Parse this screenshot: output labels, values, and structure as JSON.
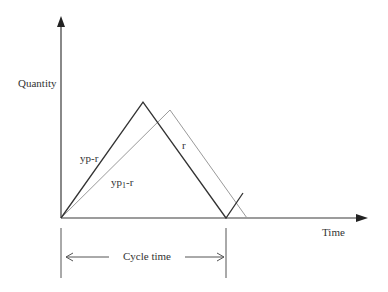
{
  "diagram": {
    "axes": {
      "y_label": "Quantity",
      "x_label": "Time"
    },
    "segments": {
      "rising_dark_label": "yp-r",
      "rising_gray_label_main": "yp",
      "rising_gray_label_sub": "1",
      "rising_gray_label_tail": "-r",
      "falling_label": "r"
    },
    "cycle": {
      "label": "Cycle time"
    },
    "colors": {
      "axis": "#3a3a3a",
      "dark_line": "#333333",
      "gray_line": "#9a9a9a",
      "text": "#333333"
    }
  }
}
